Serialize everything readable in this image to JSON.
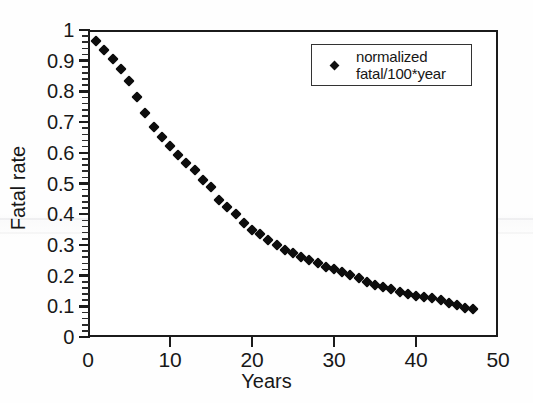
{
  "chart_data": {
    "type": "scatter",
    "title": "",
    "xlabel": "Years",
    "ylabel": "Fatal rate",
    "xlim": [
      0,
      50
    ],
    "ylim": [
      0,
      1
    ],
    "xticks": [
      0,
      10,
      20,
      30,
      40,
      50
    ],
    "xtick_labels": [
      "0",
      "10",
      "20",
      "30",
      "40",
      "50"
    ],
    "yticks": [
      0,
      0.1,
      0.2,
      0.3,
      0.4,
      0.5,
      0.6,
      0.7,
      0.8,
      0.9,
      1
    ],
    "ytick_labels": [
      "0",
      "0.1",
      "0.2",
      "0.3",
      "0.4",
      "0.5",
      "0.6",
      "0.7",
      "0.8",
      "0.9",
      "1"
    ],
    "y_minor_tick_step": 0.02,
    "grid": false,
    "legend_position": "top-right",
    "marker": "diamond",
    "marker_color": "#0d0d0d",
    "series": [
      {
        "name": "normalized fatal/100*year",
        "legend_line1": "normalized",
        "legend_line2": "fatal/100*year",
        "x": [
          1,
          2,
          3,
          4,
          5,
          6,
          7,
          8,
          9,
          10,
          11,
          12,
          13,
          14,
          15,
          16,
          17,
          18,
          19,
          20,
          21,
          22,
          23,
          24,
          25,
          26,
          27,
          28,
          29,
          30,
          31,
          32,
          33,
          34,
          35,
          36,
          37,
          38,
          39,
          40,
          41,
          42,
          43,
          44,
          45,
          46,
          47
        ],
        "y": [
          0.965,
          0.935,
          0.905,
          0.873,
          0.833,
          0.782,
          0.73,
          0.683,
          0.653,
          0.622,
          0.593,
          0.568,
          0.543,
          0.513,
          0.487,
          0.447,
          0.425,
          0.4,
          0.372,
          0.35,
          0.335,
          0.315,
          0.3,
          0.285,
          0.272,
          0.262,
          0.252,
          0.24,
          0.228,
          0.222,
          0.213,
          0.203,
          0.192,
          0.18,
          0.17,
          0.162,
          0.155,
          0.148,
          0.14,
          0.133,
          0.13,
          0.128,
          0.12,
          0.112,
          0.103,
          0.096,
          0.091
        ]
      }
    ]
  },
  "axes": {
    "y_title": "Fatal rate",
    "x_title": "Years"
  },
  "legend": {
    "line1": "normalized",
    "line2": "fatal/100*year"
  },
  "colors": {
    "marker": "#0d0d0d",
    "frame": "#1b1b1b",
    "background": "#ffffff",
    "text": "#181818"
  }
}
